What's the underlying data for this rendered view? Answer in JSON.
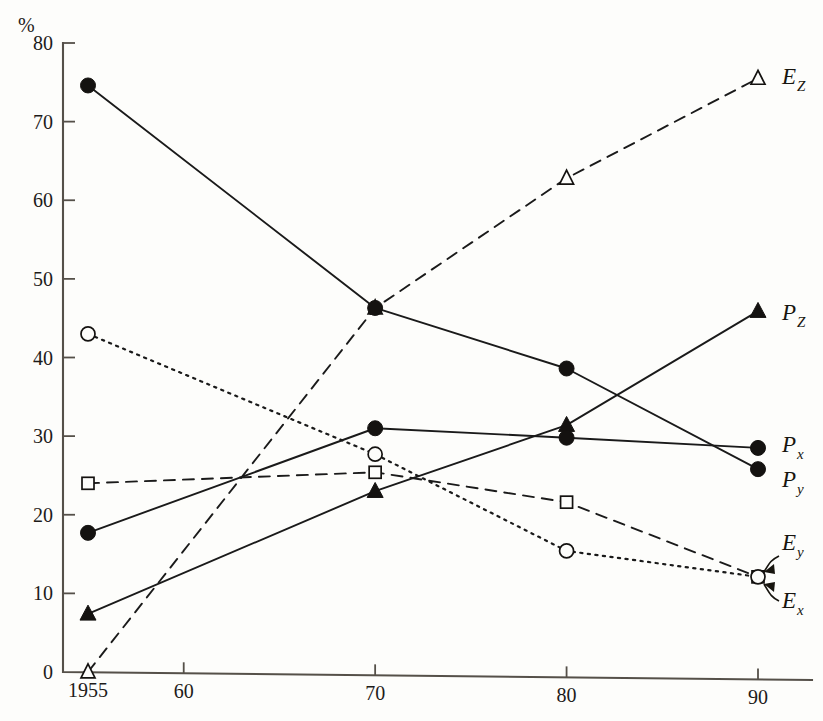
{
  "chart_data": {
    "type": "line",
    "title": "",
    "subtitle": "",
    "xlabel": "",
    "ylabel": "",
    "yunit": "%",
    "x": [
      1955,
      1970,
      1980,
      1990
    ],
    "xtick_labels": [
      "1955",
      "60",
      "70",
      "80",
      "90"
    ],
    "xtick_values": [
      1955,
      1960,
      1970,
      1980,
      1990
    ],
    "ytick_labels": [
      "0",
      "10",
      "20",
      "30",
      "40",
      "50",
      "60",
      "70",
      "80"
    ],
    "ytick_values": [
      0,
      10,
      20,
      30,
      40,
      50,
      60,
      70,
      80
    ],
    "xlim": [
      1954,
      1992
    ],
    "ylim": [
      0,
      80
    ],
    "grid": false,
    "legend_position": "right-inline-labels",
    "series": [
      {
        "name": "E_Z",
        "label": "E",
        "sublabel": "Z",
        "marker": "open-triangle",
        "linestyle": "dashed",
        "x": [
          1955,
          1970,
          1980,
          1990
        ],
        "values": [
          0,
          46.3,
          62.8,
          75.5
        ]
      },
      {
        "name": "P_Z",
        "label": "P",
        "sublabel": "Z",
        "marker": "filled-triangle",
        "linestyle": "solid",
        "x": [
          1955,
          1970,
          1980,
          1990
        ],
        "values": [
          7.4,
          23.0,
          31.4,
          45.9
        ]
      },
      {
        "name": "P_x",
        "label": "P",
        "sublabel": "x",
        "marker": "filled-circle",
        "linestyle": "solid",
        "x": [
          1955,
          1970,
          1980,
          1990
        ],
        "values": [
          17.7,
          31.0,
          29.8,
          28.5
        ]
      },
      {
        "name": "P_y",
        "label": "P",
        "sublabel": "y",
        "marker": "filled-circle",
        "linestyle": "solid",
        "x": [
          1955,
          1970,
          1980,
          1990
        ],
        "values": [
          74.6,
          46.3,
          38.6,
          25.8
        ]
      },
      {
        "name": "E_y",
        "label": "E",
        "sublabel": "y",
        "marker": "open-square",
        "linestyle": "dashed",
        "x": [
          1955,
          1970,
          1980,
          1990
        ],
        "values": [
          24.0,
          25.4,
          21.6,
          12.1
        ]
      },
      {
        "name": "E_x",
        "label": "E",
        "sublabel": "x",
        "marker": "open-circle",
        "linestyle": "dotted",
        "x": [
          1955,
          1970,
          1980,
          1990
        ],
        "values": [
          43.0,
          27.7,
          15.4,
          12.1
        ]
      }
    ],
    "callouts": [
      {
        "name": "E_y",
        "label": "E",
        "sublabel": "y"
      },
      {
        "name": "E_x",
        "label": "E",
        "sublabel": "x"
      }
    ]
  }
}
